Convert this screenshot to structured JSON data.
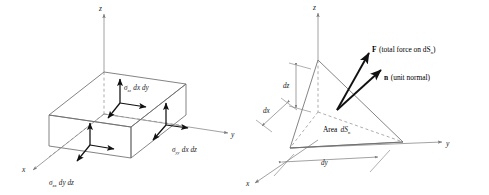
{
  "figure": {
    "panels": [
      {
        "id": "left",
        "name": "stress-components-box",
        "axes": {
          "x": "x",
          "y": "y",
          "z": "z"
        },
        "labels": [
          {
            "key": "sigma_zz",
            "sigma": "σ",
            "sub": "zz",
            "product": "dx dy"
          },
          {
            "key": "sigma_xx",
            "sigma": "σ",
            "sub": "xx",
            "product": "dy dz"
          },
          {
            "key": "sigma_yy",
            "sigma": "σ",
            "sub": "yy",
            "product": "dx dz"
          }
        ]
      },
      {
        "id": "right",
        "name": "tetrahedron-traction",
        "axes": {
          "x": "x",
          "y": "y",
          "z": "z"
        },
        "dims": [
          {
            "key": "dz",
            "text": "dz"
          },
          {
            "key": "dx",
            "text": "dx"
          },
          {
            "key": "dy",
            "text": "dy"
          }
        ],
        "annotations": [
          {
            "key": "force",
            "symbol": "F",
            "text": "(total force on dS",
            "sub": "n",
            "tail": ")"
          },
          {
            "key": "normal",
            "symbol": "n",
            "text": "(unit normal)",
            "sub": "",
            "tail": ""
          },
          {
            "key": "area",
            "symbol": "Area",
            "text": "dS",
            "sub": "n",
            "tail": ""
          }
        ]
      }
    ],
    "colors": {
      "line": "#8a8a8a",
      "edge": "#6e6e6e",
      "arrow": "#111111",
      "text": "#1a1a1a",
      "background": "#ffffff"
    }
  }
}
